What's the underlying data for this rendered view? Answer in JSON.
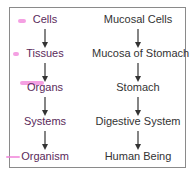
{
  "diagram": {
    "left_column": [
      "Cells",
      "Tissues",
      "Organs",
      "Systems",
      "Organism"
    ],
    "right_column": [
      "Mucosal Cells",
      "Mucosa of Stomach",
      "Stomach",
      "Digestive System",
      "Human Being"
    ],
    "colors": {
      "border": "#8a8a8a",
      "highlight": "#f080d8",
      "text": "#333333",
      "arrow": "#333333"
    }
  }
}
